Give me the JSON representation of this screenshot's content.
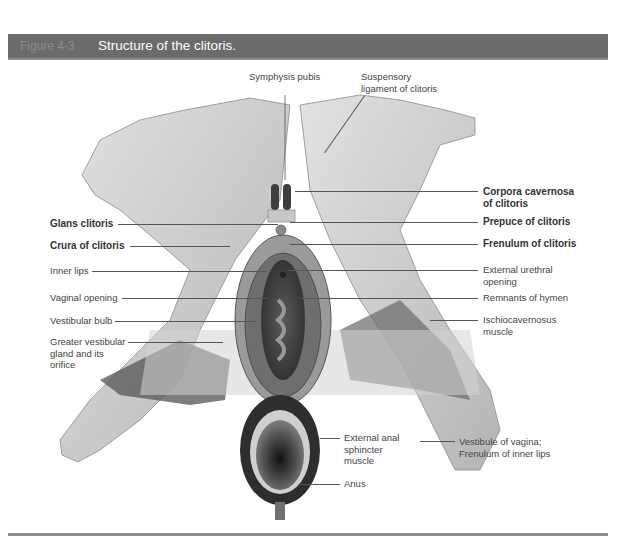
{
  "header": {
    "figure_number": "Figure 4-3",
    "title": "Structure of the clitoris."
  },
  "colors": {
    "header_bg": "#6b6b6b",
    "header_title": "#ffffff",
    "header_fignum": "#8c8c8c",
    "rule": "#8e8e8e",
    "tissue_light": "#d6d6d6",
    "tissue_mid": "#a8a8a8",
    "tissue_dark": "#3a3a3a"
  },
  "labels": {
    "top": [
      {
        "id": "symphysis-pubis",
        "text": "Symphysis pubis",
        "bold": false
      },
      {
        "id": "suspensory-ligament",
        "text": "Suspensory\nligament of clitoris",
        "bold": false
      }
    ],
    "left": [
      {
        "id": "glans-clitoris",
        "text": "Glans clitoris",
        "bold": true
      },
      {
        "id": "crura-of-clitoris",
        "text": "Crura of clitoris",
        "bold": true
      },
      {
        "id": "inner-lips",
        "text": "Inner lips",
        "bold": false
      },
      {
        "id": "vaginal-opening",
        "text": "Vaginal opening",
        "bold": false
      },
      {
        "id": "vestibular-bulb",
        "text": "Vestibular bulb",
        "bold": false
      },
      {
        "id": "greater-vestibular-gland",
        "text": "Greater vestibular\ngland and its\norifice",
        "bold": false
      }
    ],
    "right": [
      {
        "id": "corpora-cavernosa",
        "text": "Corpora cavernosa\nof clitoris",
        "bold": true
      },
      {
        "id": "prepuce-of-clitoris",
        "text": "Prepuce of clitoris",
        "bold": true
      },
      {
        "id": "frenulum-of-clitoris",
        "text": "Frenulum of clitoris",
        "bold": true
      },
      {
        "id": "external-urethral-opening",
        "text": "External urethral\nopening",
        "bold": false
      },
      {
        "id": "remnants-of-hymen",
        "text": "Remnants of hymen",
        "bold": false
      },
      {
        "id": "ischiocavernosus-muscle",
        "text": "Ischiocavernosus\nmuscle",
        "bold": false
      }
    ],
    "bottom": [
      {
        "id": "external-anal-sphincter",
        "text": "External anal\nsphincter\nmuscle",
        "bold": false
      },
      {
        "id": "anus",
        "text": "Anus",
        "bold": false
      },
      {
        "id": "vestibule-of-vagina",
        "text": "Vestibule of vagina;\nFrenulum of inner lips",
        "bold": false
      }
    ]
  }
}
